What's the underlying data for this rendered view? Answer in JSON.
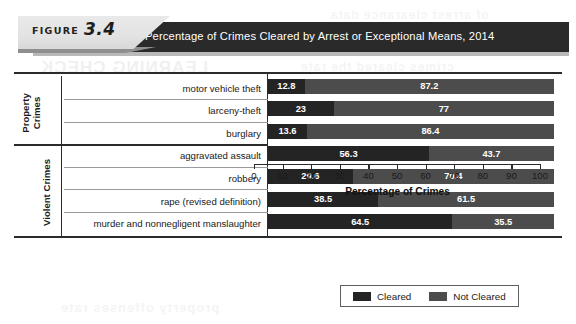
{
  "figure": {
    "label": "FIGURE",
    "number": "3.4",
    "title": "Percentage of Crimes Cleared by Arrest or Exceptional Means, 2014"
  },
  "groups": [
    {
      "name": "Property Crimes",
      "line1": "Property",
      "line2": "Crimes"
    },
    {
      "name": "Violent Crimes",
      "line1": "Violent Crimes",
      "line2": ""
    }
  ],
  "legend": {
    "position": "bottom-right",
    "items": [
      {
        "label": "Cleared",
        "color": "#242424"
      },
      {
        "label": "Not Cleared",
        "color": "#4c4c4c"
      }
    ]
  },
  "chart_data": {
    "type": "bar",
    "orientation": "horizontal",
    "stacked": true,
    "title": "Percentage of Crimes Cleared by Arrest or Exceptional Means, 2014",
    "xlabel": "Percentage of Crimes",
    "ylabel": "",
    "xlim": [
      0,
      100
    ],
    "xticks": [
      0,
      10,
      20,
      30,
      40,
      50,
      60,
      70,
      80,
      90,
      100
    ],
    "grid": false,
    "legend_position": "bottom-right",
    "categories": [
      "motor vehicle theft",
      "larceny-theft",
      "burglary",
      "aggravated assault",
      "robbery",
      "rape (revised definition)",
      "murder and nonnegligent manslaughter"
    ],
    "category_groups": [
      "Property Crimes",
      "Property Crimes",
      "Property Crimes",
      "Violent Crimes",
      "Violent Crimes",
      "Violent Crimes",
      "Violent Crimes"
    ],
    "series": [
      {
        "name": "Cleared",
        "color": "#242424",
        "values": [
          12.8,
          23,
          13.6,
          56.3,
          29.6,
          38.5,
          64.5
        ],
        "labels": [
          "12.8",
          "23",
          "13.6",
          "56.3",
          "29.6",
          "38.5",
          "64.5"
        ]
      },
      {
        "name": "Not Cleared",
        "color": "#4c4c4c",
        "values": [
          87.2,
          77,
          86.4,
          43.7,
          70.4,
          61.5,
          35.5
        ],
        "labels": [
          "87.2",
          "77",
          "86.4",
          "43.7",
          "70.4",
          "61.5",
          "35.5"
        ]
      }
    ]
  },
  "bleed": {
    "a": "LEARNING CHECK",
    "b": "crimes cleared the rate",
    "c": "property offenses rate",
    "d": "of arrest clearance data"
  }
}
